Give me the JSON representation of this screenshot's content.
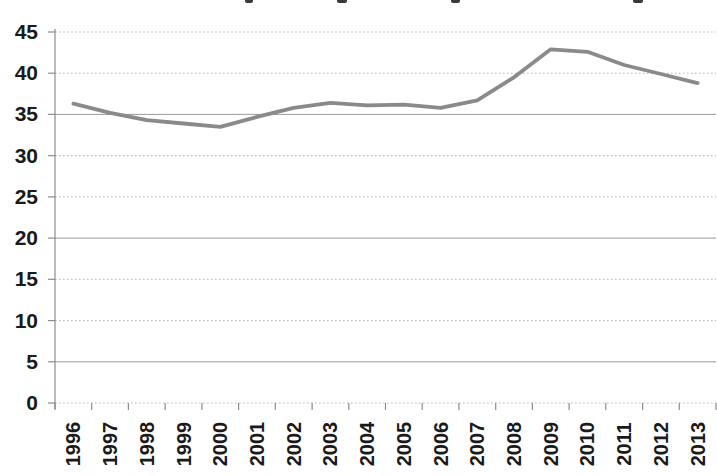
{
  "window": {
    "background": "#ffffff",
    "cropped_title_note": "only bottom descender tips of a cut-off chart title are visible at the top edge"
  },
  "chart_data": {
    "type": "line",
    "title": "",
    "xlabel": "",
    "ylabel": "",
    "categories": [
      "1996",
      "1997",
      "1998",
      "1999",
      "2000",
      "2001",
      "2002",
      "2003",
      "2004",
      "2005",
      "2006",
      "2007",
      "2008",
      "2009",
      "2010",
      "2011",
      "2012",
      "2013"
    ],
    "values": [
      36.3,
      35.2,
      34.3,
      33.9,
      33.5,
      34.7,
      35.8,
      36.4,
      36.1,
      36.2,
      35.8,
      36.7,
      39.5,
      42.9,
      42.6,
      41.0,
      39.9,
      38.8
    ],
    "ylim": [
      0,
      45
    ],
    "yticks": [
      0,
      5,
      10,
      15,
      20,
      25,
      30,
      35,
      40,
      45
    ],
    "ytick_labels": [
      "0",
      "5",
      "10",
      "15",
      "20",
      "25",
      "30",
      "35",
      "40",
      "45"
    ],
    "grid": "horizontal gridlines on; dotted, with solid lines at 5, 20 and 35",
    "solid_gridline_levels": [
      5,
      20,
      35
    ],
    "legend": "none",
    "x_label_rotation_deg": -90
  },
  "colors": {
    "series_line": "#8a8a8a",
    "gridline_dotted": "#b5b5b5",
    "gridline_solid": "#9b9b9b",
    "axis": "#8c8c8c",
    "tick": "#8c8c8c",
    "axis_label_text": "#1a1a1a",
    "background": "#ffffff",
    "title_fragment": "#3a3a3a"
  }
}
